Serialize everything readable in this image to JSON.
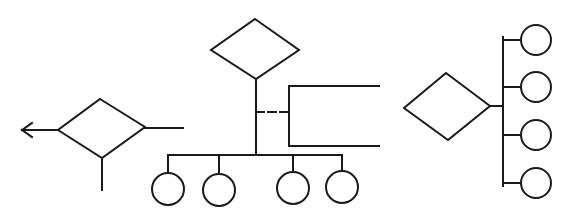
{
  "diagram": {
    "type": "er-notation-symbols",
    "colors": {
      "stroke": "#1a1a1a",
      "background": "#ffffff"
    },
    "groups": [
      {
        "id": "left",
        "description": "relationship diamond with outgoing arrow left, line right, line down",
        "diamond": {
          "top": [
            100,
            99
          ],
          "right": [
            145,
            127
          ],
          "bottom": [
            102,
            158
          ],
          "left": [
            58,
            130
          ]
        },
        "arrow": {
          "from": [
            58,
            130
          ],
          "to": [
            22,
            130
          ]
        },
        "lines": [
          {
            "from": [
              145,
              128
            ],
            "to": [
              183,
              128
            ]
          },
          {
            "from": [
              102,
              158
            ],
            "to": [
              102,
              190
            ]
          }
        ]
      },
      {
        "id": "center",
        "description": "relationship diamond with trunk, dashed link to bracket, bus to four entity circles",
        "diamond": {
          "top": [
            255,
            19
          ],
          "right": [
            299,
            50
          ],
          "bottom": [
            256,
            79
          ],
          "left": [
            211,
            50
          ]
        },
        "trunk": {
          "from": [
            256,
            79
          ],
          "to": [
            256,
            155
          ]
        },
        "dashed": {
          "from": [
            256,
            112
          ],
          "to": [
            289,
            112
          ]
        },
        "bracket": {
          "x": 289,
          "y_top": 86,
          "y_bottom": 146,
          "x_end": 379
        },
        "bus": {
          "y": 155,
          "x_start": 168,
          "x_end": 342
        },
        "circles": [
          {
            "cx": 168,
            "cy": 189,
            "r": 16
          },
          {
            "cx": 219,
            "cy": 190,
            "r": 16
          },
          {
            "cx": 293,
            "cy": 188,
            "r": 16
          },
          {
            "cx": 342,
            "cy": 187,
            "r": 16
          }
        ]
      },
      {
        "id": "right",
        "description": "relationship diamond linked to vertical bus with four entity circles",
        "diamond": {
          "top": [
            446,
            73
          ],
          "right": [
            490,
            106
          ],
          "bottom": [
            448,
            140
          ],
          "left": [
            404,
            108
          ]
        },
        "link": {
          "from": [
            490,
            106
          ],
          "to": [
            503,
            106
          ]
        },
        "bus": {
          "x": 503,
          "y_start": 37,
          "y_end": 186
        },
        "circles": [
          {
            "cx": 536,
            "cy": 40,
            "r": 15
          },
          {
            "cx": 536,
            "cy": 87,
            "r": 15
          },
          {
            "cx": 536,
            "cy": 135,
            "r": 15
          },
          {
            "cx": 536,
            "cy": 183,
            "r": 15
          }
        ]
      }
    ]
  }
}
